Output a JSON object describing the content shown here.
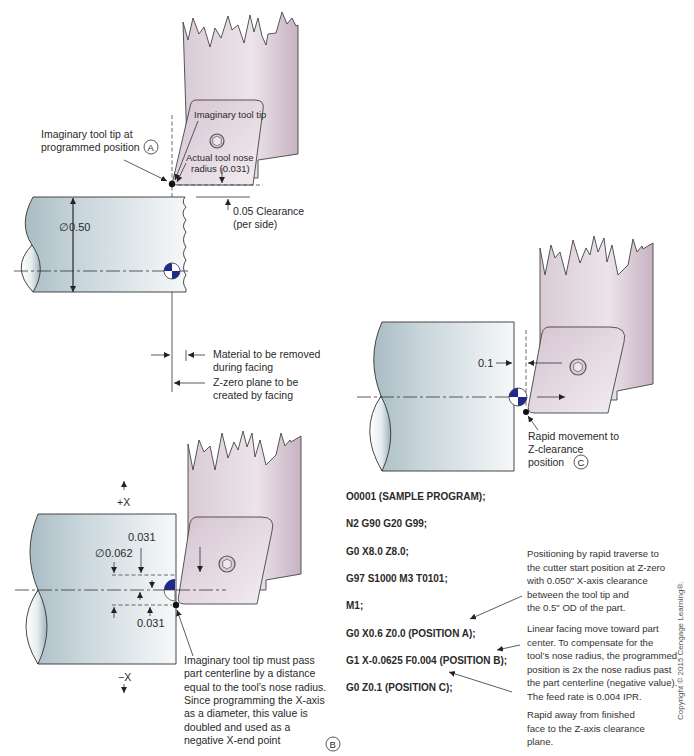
{
  "view_a": {
    "label_tip_programmed_1": "Imaginary tool tip at",
    "label_tip_programmed_2": "programmed position",
    "marker": "A",
    "label_imaginary_tip": "Imaginary tool tip",
    "label_nose_radius_1": "Actual tool nose",
    "label_nose_radius_2": "radius (0.031)",
    "label_clearance_1": "0.05 Clearance",
    "label_clearance_2": "(per side)",
    "label_diameter": "∅0.50",
    "label_material_1": "Material to be removed",
    "label_material_2": "during facing",
    "label_zzero_1": "Z-zero plane to be",
    "label_zzero_2": "created by facing"
  },
  "view_b": {
    "label_plus_x": "+X",
    "label_minus_x": "−X",
    "label_dim_031_top": "0.031",
    "label_dim_062": "∅0.062",
    "label_dim_031_bottom": "0.031",
    "note_lines": [
      "Imaginary tool tip must pass",
      "part centerline by a distance",
      "equal to the tool’s nose radius.",
      "Since programming the X-axis",
      "as a diameter, this value is",
      "doubled and used as a",
      "negative X-end point"
    ],
    "marker": "B"
  },
  "view_c": {
    "label_dim": "0.1",
    "label_rapid_1": "Rapid movement to",
    "label_rapid_2": "Z-clearance",
    "label_rapid_3": "position",
    "marker": "C"
  },
  "program": {
    "lines": [
      "O0001 (SAMPLE PROGRAM);",
      "N2 G90 G20 G99;",
      "G0 X8.0 Z8.0;",
      "G97 S1000 M3 T0101;",
      "M1;",
      "G0 X0.6 Z0.0 (POSITION A);",
      "G1 X-0.0625 F0.004 (POSITION B);",
      "G0 Z0.1 (POSITION C);"
    ]
  },
  "notes": {
    "position_a": [
      "Positioning by rapid traverse to",
      "the cutter start position at Z-zero",
      "with 0.050\" X-axis clearance",
      "between the tool tip and",
      "the 0.5\" OD of the part."
    ],
    "position_b": [
      "Linear facing move toward part",
      "center.  To compensate for the",
      "tool’s nose radius, the programmed",
      "position is 2x the nose radius past",
      "the part centerline (negative value).",
      "The feed rate is 0.004 IPR."
    ],
    "position_c": [
      "Rapid away from finished",
      "face to the Z-axis clearance",
      "plane."
    ]
  },
  "copyright": "Copyright © 2015 Cengage Learning®.",
  "colors": {
    "part_fill_dark": "#a9bcc4",
    "part_fill_light": "#f4f7f8",
    "tool_fill_dark": "#c8b6c4",
    "tool_fill_light": "#f1ebef",
    "centroid_blue": "#1f2a8c"
  }
}
